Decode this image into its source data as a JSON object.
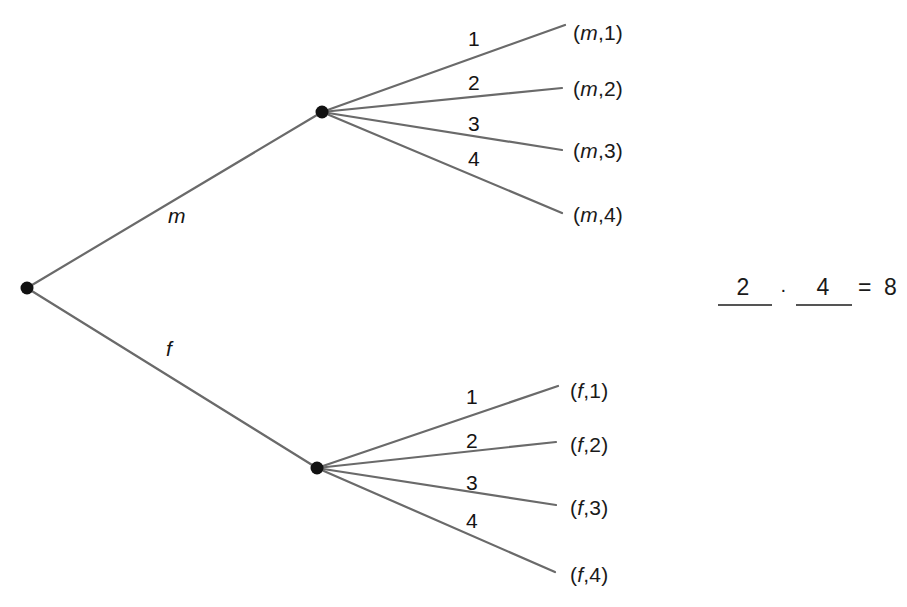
{
  "diagram": {
    "type": "probability-tree",
    "background_color": "#ffffff",
    "edge_color": "#6a6a6a",
    "node_color": "#111111",
    "root": {
      "name": "root-node",
      "x": 27,
      "y": 288
    },
    "level1": {
      "branches": [
        {
          "label": "m",
          "node_name": "node-m",
          "x": 322,
          "y": 112,
          "label_x": 168,
          "label_y": 205
        },
        {
          "label": "f",
          "node_name": "node-f",
          "x": 317,
          "y": 468,
          "label_x": 166,
          "label_y": 338
        }
      ]
    },
    "level2": {
      "branch_labels": [
        "1",
        "2",
        "3",
        "4"
      ],
      "m_subtree": {
        "parent": "m",
        "branch_label_positions": [
          {
            "label": "1",
            "x": 468,
            "y": 28
          },
          {
            "label": "2",
            "x": 468,
            "y": 72
          },
          {
            "label": "3",
            "x": 468,
            "y": 113
          },
          {
            "label": "4",
            "x": 468,
            "y": 148
          }
        ],
        "leaves": [
          {
            "label": "(m,1)",
            "first": "m",
            "second": "1",
            "line_end_x": 565,
            "line_end_y": 25,
            "label_x": 573,
            "label_y": 22
          },
          {
            "label": "(m,2)",
            "first": "m",
            "second": "2",
            "line_end_x": 562,
            "line_end_y": 88,
            "label_x": 573,
            "label_y": 78
          },
          {
            "label": "(m,3)",
            "first": "m",
            "second": "3",
            "line_end_x": 562,
            "line_end_y": 150,
            "label_x": 573,
            "label_y": 140
          },
          {
            "label": "(m,4)",
            "first": "m",
            "second": "4",
            "line_end_x": 562,
            "line_end_y": 213,
            "label_x": 573,
            "label_y": 204
          }
        ]
      },
      "f_subtree": {
        "parent": "f",
        "branch_label_positions": [
          {
            "label": "1",
            "x": 466,
            "y": 386
          },
          {
            "label": "2",
            "x": 466,
            "y": 430
          },
          {
            "label": "3",
            "x": 466,
            "y": 472
          },
          {
            "label": "4",
            "x": 466,
            "y": 510
          }
        ],
        "leaves": [
          {
            "label": "(f,1)",
            "first": "f",
            "second": "1",
            "line_end_x": 558,
            "line_end_y": 386,
            "label_x": 570,
            "label_y": 380
          },
          {
            "label": "(f,2)",
            "first": "f",
            "second": "2",
            "line_end_x": 556,
            "line_end_y": 442,
            "label_x": 570,
            "label_y": 434
          },
          {
            "label": "(f,3)",
            "first": "f",
            "second": "3",
            "line_end_x": 556,
            "line_end_y": 505,
            "label_x": 570,
            "label_y": 497
          },
          {
            "label": "(f,4)",
            "first": "f",
            "second": "4",
            "line_end_x": 555,
            "line_end_y": 572,
            "label_x": 570,
            "label_y": 564
          }
        ]
      }
    }
  },
  "equation": {
    "name": "counting-equation",
    "factor1": "2",
    "operator": "·",
    "factor2": "4",
    "equals": "=",
    "result": "8",
    "full_text": "2 · 4 = 8"
  },
  "chart_data": {
    "type": "tree",
    "levels": 2,
    "level_labels": [
      [
        "m",
        "f"
      ],
      [
        "1",
        "2",
        "3",
        "4"
      ]
    ],
    "outcomes": [
      "(m,1)",
      "(m,2)",
      "(m,3)",
      "(m,4)",
      "(f,1)",
      "(f,2)",
      "(f,3)",
      "(f,4)"
    ],
    "outcome_count": 8,
    "factors": [
      2,
      4
    ],
    "product": 8
  }
}
